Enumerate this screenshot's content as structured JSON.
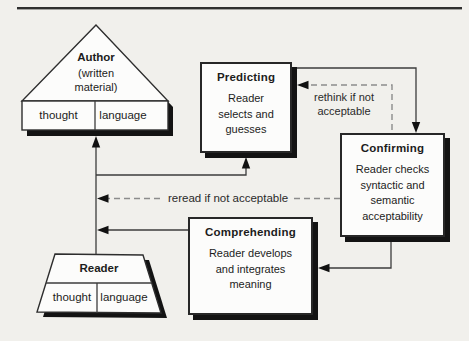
{
  "colors": {
    "background": "#f1f0ec",
    "box_fill": "#fcfcfb",
    "border": "#272727",
    "shadow": "#131313",
    "solid_line": "#3c3c3c",
    "dashed_line": "#8c8c8c",
    "text": "#1c1c1c"
  },
  "author": {
    "title": "Author",
    "subtitle": "(written\nmaterial)",
    "cells": [
      "thought",
      "language"
    ]
  },
  "reader": {
    "title": "Reader",
    "cells": [
      "thought",
      "language"
    ]
  },
  "processes": {
    "predicting": {
      "title": "Predicting",
      "body": "Reader\nselects and\nguesses"
    },
    "confirming": {
      "title": "Confirming",
      "body": "Reader checks\nsyntactic and\nsemantic\nacceptability"
    },
    "comprehending": {
      "title": "Comprehending",
      "body": "Reader develops\nand integrates\nmeaning"
    }
  },
  "annotations": {
    "rethink": "rethink if not\nacceptable",
    "reread": "reread if not acceptable"
  }
}
